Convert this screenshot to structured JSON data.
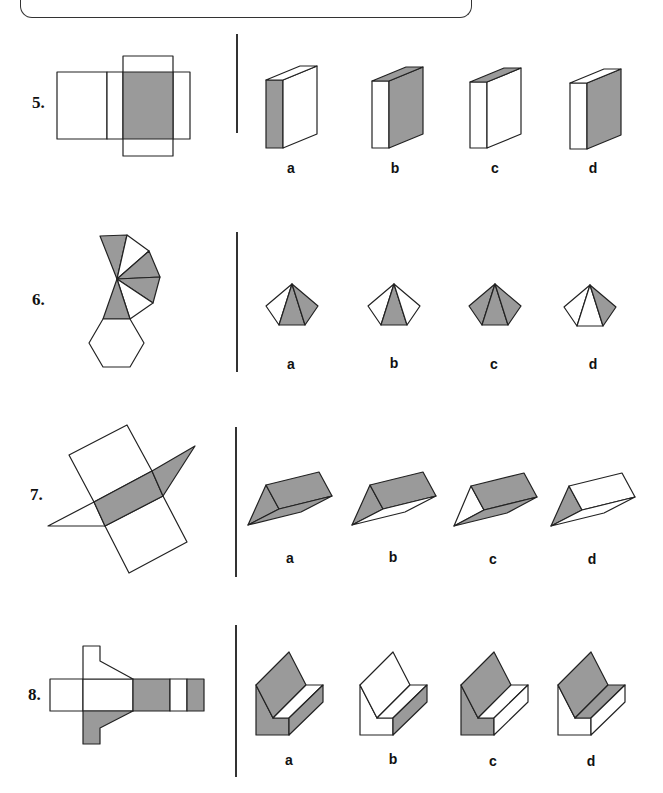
{
  "page": {
    "type": "worksheet",
    "colors": {
      "shade": "#9a9a9a",
      "line": "#222222",
      "background": "#ffffff"
    }
  },
  "questions": [
    {
      "number": "5.",
      "net": "rectangular-prism-net",
      "options": [
        {
          "label": "a",
          "shape": "rectangular-prism"
        },
        {
          "label": "b",
          "shape": "rectangular-prism"
        },
        {
          "label": "c",
          "shape": "rectangular-prism"
        },
        {
          "label": "d",
          "shape": "rectangular-prism"
        }
      ]
    },
    {
      "number": "6.",
      "net": "hexagonal-pyramid-net",
      "options": [
        {
          "label": "a",
          "shape": "hexagonal-pyramid"
        },
        {
          "label": "b",
          "shape": "hexagonal-pyramid"
        },
        {
          "label": "c",
          "shape": "hexagonal-pyramid"
        },
        {
          "label": "d",
          "shape": "hexagonal-pyramid"
        }
      ]
    },
    {
      "number": "7.",
      "net": "triangular-prism-net",
      "options": [
        {
          "label": "a",
          "shape": "triangular-prism"
        },
        {
          "label": "b",
          "shape": "triangular-prism"
        },
        {
          "label": "c",
          "shape": "triangular-prism"
        },
        {
          "label": "d",
          "shape": "triangular-prism"
        }
      ]
    },
    {
      "number": "8.",
      "net": "l-shaped-prism-net",
      "options": [
        {
          "label": "a",
          "shape": "l-shaped-prism"
        },
        {
          "label": "b",
          "shape": "l-shaped-prism"
        },
        {
          "label": "c",
          "shape": "l-shaped-prism"
        },
        {
          "label": "d",
          "shape": "l-shaped-prism"
        }
      ]
    }
  ]
}
